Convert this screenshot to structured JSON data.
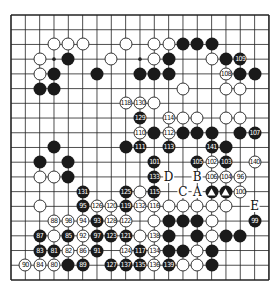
{
  "diagram": {
    "type": "go-board",
    "size": 19,
    "origin": {
      "x": 11,
      "y": 15
    },
    "spacing": {
      "x": 14.33,
      "y": 14.72
    },
    "colors": {
      "line": "#222222",
      "black": "#1a1a1a",
      "white": "#ffffff",
      "background": "#ffffff"
    },
    "stones": [
      {
        "c": 3,
        "r": 2,
        "color": "w",
        "n": ""
      },
      {
        "c": 4,
        "r": 2,
        "color": "w",
        "n": ""
      },
      {
        "c": 5,
        "r": 2,
        "color": "w",
        "n": ""
      },
      {
        "c": 8,
        "r": 2,
        "color": "w",
        "n": ""
      },
      {
        "c": 10,
        "r": 2,
        "color": "w",
        "n": ""
      },
      {
        "c": 11,
        "r": 2,
        "color": "w",
        "n": ""
      },
      {
        "c": 12,
        "r": 2,
        "color": "b",
        "n": ""
      },
      {
        "c": 13,
        "r": 2,
        "color": "b",
        "n": ""
      },
      {
        "c": 14,
        "r": 2,
        "color": "b",
        "n": ""
      },
      {
        "c": 2,
        "r": 3,
        "color": "w",
        "n": ""
      },
      {
        "c": 4,
        "r": 3,
        "color": "b",
        "n": ""
      },
      {
        "c": 7,
        "r": 3,
        "color": "w",
        "n": ""
      },
      {
        "c": 10,
        "r": 3,
        "color": "w",
        "n": ""
      },
      {
        "c": 11,
        "r": 3,
        "color": "b",
        "n": ""
      },
      {
        "c": 14,
        "r": 3,
        "color": "w",
        "n": ""
      },
      {
        "c": 15,
        "r": 3,
        "color": "b",
        "n": ""
      },
      {
        "c": 16,
        "r": 3,
        "color": "b",
        "n": "109"
      },
      {
        "c": 2,
        "r": 4,
        "color": "w",
        "n": ""
      },
      {
        "c": 3,
        "r": 4,
        "color": "b",
        "n": ""
      },
      {
        "c": 6,
        "r": 4,
        "color": "b",
        "n": ""
      },
      {
        "c": 9,
        "r": 4,
        "color": "b",
        "n": ""
      },
      {
        "c": 10,
        "r": 4,
        "color": "b",
        "n": ""
      },
      {
        "c": 11,
        "r": 4,
        "color": "b",
        "n": ""
      },
      {
        "c": 15,
        "r": 4,
        "color": "w",
        "n": "108"
      },
      {
        "c": 16,
        "r": 4,
        "color": "b",
        "n": ""
      },
      {
        "c": 17,
        "r": 4,
        "color": "b",
        "n": ""
      },
      {
        "c": 2,
        "r": 5,
        "color": "b",
        "n": ""
      },
      {
        "c": 3,
        "r": 5,
        "color": "b",
        "n": ""
      },
      {
        "c": 12,
        "r": 5,
        "color": "w",
        "n": ""
      },
      {
        "c": 15,
        "r": 5,
        "color": "w",
        "n": ""
      },
      {
        "c": 16,
        "r": 5,
        "color": "w",
        "n": ""
      },
      {
        "c": 8,
        "r": 6,
        "color": "w",
        "n": "118"
      },
      {
        "c": 9,
        "r": 6,
        "color": "w",
        "n": "130"
      },
      {
        "c": 10,
        "r": 6,
        "color": "w",
        "n": ""
      },
      {
        "c": 9,
        "r": 7,
        "color": "b",
        "n": "129"
      },
      {
        "c": 11,
        "r": 7,
        "color": "w",
        "n": "114"
      },
      {
        "c": 12,
        "r": 7,
        "color": "w",
        "n": ""
      },
      {
        "c": 13,
        "r": 7,
        "color": "w",
        "n": ""
      },
      {
        "c": 15,
        "r": 7,
        "color": "w",
        "n": ""
      },
      {
        "c": 16,
        "r": 7,
        "color": "w",
        "n": ""
      },
      {
        "c": 9,
        "r": 8,
        "color": "w",
        "n": "110"
      },
      {
        "c": 10,
        "r": 8,
        "color": "b",
        "n": ""
      },
      {
        "c": 11,
        "r": 8,
        "color": "w",
        "n": "112"
      },
      {
        "c": 12,
        "r": 8,
        "color": "b",
        "n": ""
      },
      {
        "c": 13,
        "r": 8,
        "color": "b",
        "n": ""
      },
      {
        "c": 14,
        "r": 8,
        "color": "b",
        "n": ""
      },
      {
        "c": 16,
        "r": 8,
        "color": "b",
        "n": ""
      },
      {
        "c": 17,
        "r": 8,
        "color": "b",
        "n": "107"
      },
      {
        "c": 3,
        "r": 9,
        "color": "b",
        "n": ""
      },
      {
        "c": 8,
        "r": 9,
        "color": "b",
        "n": ""
      },
      {
        "c": 9,
        "r": 9,
        "color": "b",
        "n": "111"
      },
      {
        "c": 11,
        "r": 9,
        "color": "b",
        "n": "113"
      },
      {
        "c": 14,
        "r": 9,
        "color": "b",
        "n": "141"
      },
      {
        "c": 15,
        "r": 9,
        "color": "b",
        "n": ""
      },
      {
        "c": 2,
        "r": 10,
        "color": "b",
        "n": ""
      },
      {
        "c": 4,
        "r": 10,
        "color": "b",
        "n": ""
      },
      {
        "c": 10,
        "r": 10,
        "color": "b",
        "n": "101"
      },
      {
        "c": 13,
        "r": 10,
        "color": "b",
        "n": "105"
      },
      {
        "c": 14,
        "r": 10,
        "color": "w",
        "n": "102"
      },
      {
        "c": 15,
        "r": 10,
        "color": "b",
        "n": "103"
      },
      {
        "c": 17,
        "r": 10,
        "color": "w",
        "n": "140"
      },
      {
        "c": 2,
        "r": 11,
        "color": "w",
        "n": ""
      },
      {
        "c": 3,
        "r": 11,
        "color": "w",
        "n": ""
      },
      {
        "c": 4,
        "r": 11,
        "color": "b",
        "n": ""
      },
      {
        "c": 10,
        "r": 11,
        "color": "b",
        "n": "133"
      },
      {
        "c": 14,
        "r": 11,
        "color": "w",
        "n": "106"
      },
      {
        "c": 15,
        "r": 11,
        "color": "w",
        "n": "104"
      },
      {
        "c": 16,
        "r": 11,
        "color": "w",
        "n": "96"
      },
      {
        "c": 5,
        "r": 12,
        "color": "b",
        "n": "131"
      },
      {
        "c": 8,
        "r": 12,
        "color": "b",
        "n": "125"
      },
      {
        "c": 9,
        "r": 12,
        "color": "w",
        "n": ""
      },
      {
        "c": 10,
        "r": 12,
        "color": "b",
        "n": "115"
      },
      {
        "c": 14,
        "r": 12,
        "color": "b",
        "n": "tri"
      },
      {
        "c": 15,
        "r": 12,
        "color": "b",
        "n": "tri"
      },
      {
        "c": 16,
        "r": 12,
        "color": "w",
        "n": "100"
      },
      {
        "c": 2,
        "r": 13,
        "color": "w",
        "n": ""
      },
      {
        "c": 5,
        "r": 13,
        "color": "b",
        "n": "95"
      },
      {
        "c": 6,
        "r": 13,
        "color": "w",
        "n": "126"
      },
      {
        "c": 7,
        "r": 13,
        "color": "w",
        "n": "120"
      },
      {
        "c": 8,
        "r": 13,
        "color": "b",
        "n": "119"
      },
      {
        "c": 9,
        "r": 13,
        "color": "w",
        "n": "132"
      },
      {
        "c": 10,
        "r": 13,
        "color": "w",
        "n": "116"
      },
      {
        "c": 11,
        "r": 13,
        "color": "w",
        "n": ""
      },
      {
        "c": 12,
        "r": 13,
        "color": "w",
        "n": ""
      },
      {
        "c": 13,
        "r": 13,
        "color": "w",
        "n": ""
      },
      {
        "c": 14,
        "r": 13,
        "color": "w",
        "n": ""
      },
      {
        "c": 15,
        "r": 13,
        "color": "w",
        "n": ""
      },
      {
        "c": 3,
        "r": 14,
        "color": "w",
        "n": "88"
      },
      {
        "c": 4,
        "r": 14,
        "color": "w",
        "n": "98"
      },
      {
        "c": 5,
        "r": 14,
        "color": "w",
        "n": "94"
      },
      {
        "c": 6,
        "r": 14,
        "color": "b",
        "n": "93"
      },
      {
        "c": 7,
        "r": 14,
        "color": "w",
        "n": "128"
      },
      {
        "c": 8,
        "r": 14,
        "color": "w",
        "n": "122"
      },
      {
        "c": 10,
        "r": 14,
        "color": "w",
        "n": ""
      },
      {
        "c": 11,
        "r": 14,
        "color": "b",
        "n": ""
      },
      {
        "c": 12,
        "r": 14,
        "color": "b",
        "n": ""
      },
      {
        "c": 13,
        "r": 14,
        "color": "b",
        "n": ""
      },
      {
        "c": 14,
        "r": 14,
        "color": "w",
        "n": ""
      },
      {
        "c": 17,
        "r": 14,
        "color": "b",
        "n": "99"
      },
      {
        "c": 2,
        "r": 15,
        "color": "b",
        "n": "87"
      },
      {
        "c": 3,
        "r": 15,
        "color": "w",
        "n": ""
      },
      {
        "c": 4,
        "r": 15,
        "color": "b",
        "n": "85"
      },
      {
        "c": 5,
        "r": 15,
        "color": "w",
        "n": "92"
      },
      {
        "c": 6,
        "r": 15,
        "color": "b",
        "n": "97"
      },
      {
        "c": 7,
        "r": 15,
        "color": "b",
        "n": "123"
      },
      {
        "c": 8,
        "r": 15,
        "color": "b",
        "n": "121"
      },
      {
        "c": 9,
        "r": 15,
        "color": "w",
        "n": ""
      },
      {
        "c": 10,
        "r": 15,
        "color": "w",
        "n": "138"
      },
      {
        "c": 11,
        "r": 15,
        "color": "b",
        "n": ""
      },
      {
        "c": 13,
        "r": 15,
        "color": "b",
        "n": ""
      },
      {
        "c": 14,
        "r": 15,
        "color": "w",
        "n": ""
      },
      {
        "c": 15,
        "r": 15,
        "color": "b",
        "n": ""
      },
      {
        "c": 16,
        "r": 15,
        "color": "b",
        "n": ""
      },
      {
        "c": 2,
        "r": 16,
        "color": "b",
        "n": "83"
      },
      {
        "c": 3,
        "r": 16,
        "color": "b",
        "n": "81"
      },
      {
        "c": 4,
        "r": 16,
        "color": "w",
        "n": "82"
      },
      {
        "c": 5,
        "r": 16,
        "color": "w",
        "n": "86"
      },
      {
        "c": 6,
        "r": 16,
        "color": "b",
        "n": "91"
      },
      {
        "c": 8,
        "r": 16,
        "color": "w",
        "n": "124"
      },
      {
        "c": 9,
        "r": 16,
        "color": "b",
        "n": "117"
      },
      {
        "c": 10,
        "r": 16,
        "color": "w",
        "n": "134"
      },
      {
        "c": 11,
        "r": 16,
        "color": "b",
        "n": ""
      },
      {
        "c": 12,
        "r": 16,
        "color": "b",
        "n": ""
      },
      {
        "c": 13,
        "r": 16,
        "color": "w",
        "n": ""
      },
      {
        "c": 14,
        "r": 16,
        "color": "b",
        "n": ""
      },
      {
        "c": 1,
        "r": 17,
        "color": "w",
        "n": "90"
      },
      {
        "c": 2,
        "r": 17,
        "color": "w",
        "n": "84"
      },
      {
        "c": 3,
        "r": 17,
        "color": "w",
        "n": "80"
      },
      {
        "c": 4,
        "r": 17,
        "color": "b",
        "n": ""
      },
      {
        "c": 5,
        "r": 17,
        "color": "b",
        "n": "89"
      },
      {
        "c": 7,
        "r": 17,
        "color": "b",
        "n": "127"
      },
      {
        "c": 8,
        "r": 17,
        "color": "b",
        "n": "137"
      },
      {
        "c": 9,
        "r": 17,
        "color": "b",
        "n": "135"
      },
      {
        "c": 10,
        "r": 17,
        "color": "w",
        "n": "136"
      },
      {
        "c": 11,
        "r": 17,
        "color": "b",
        "n": "139"
      },
      {
        "c": 12,
        "r": 17,
        "color": "w",
        "n": ""
      },
      {
        "c": 13,
        "r": 17,
        "color": "w",
        "n": ""
      },
      {
        "c": 14,
        "r": 17,
        "color": "b",
        "n": ""
      }
    ],
    "labels": [
      {
        "c": 11,
        "r": 11,
        "text": "D"
      },
      {
        "c": 13,
        "r": 11,
        "text": "B"
      },
      {
        "c": 12,
        "r": 12,
        "text": "C"
      },
      {
        "c": 13,
        "r": 12,
        "text": "A"
      },
      {
        "c": 17,
        "r": 13,
        "text": "E"
      }
    ]
  }
}
